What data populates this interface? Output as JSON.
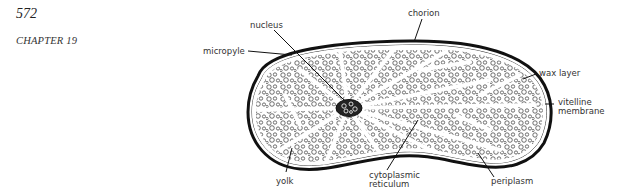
{
  "header": {
    "page_number": "572",
    "chapter": "CHAPTER 19"
  },
  "figure": {
    "labels": {
      "nucleus": "nucleus",
      "chorion": "chorion",
      "micropyle": "micropyle",
      "wax_layer": "wax layer",
      "vitelline_line1": "vitelline",
      "vitelline_line2": "membrane",
      "yolk": "yolk",
      "cytoplasmic_line1": "cytoplasmic",
      "cytoplasmic_line2": "reticulum",
      "periplasm": "periplasm"
    }
  }
}
